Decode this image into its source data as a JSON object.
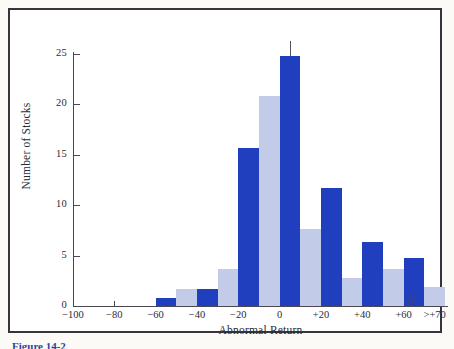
{
  "figure": {
    "caption": "Figure 14-2",
    "frame_color": "#36343a",
    "background": "#ffffff"
  },
  "colors": {
    "dark_bar": "#1f3fbf",
    "light_bar": "#c2cbe8",
    "axis": "#4a4750",
    "text": "#2b2b33",
    "caption": "#2f3f9e"
  },
  "chart_data": {
    "type": "bar",
    "title": "",
    "xlabel": "Abnormal Return",
    "ylabel": "Number of Stocks",
    "ylim": [
      0,
      26
    ],
    "yticks": [
      0,
      5,
      10,
      15,
      20,
      25
    ],
    "ytick_labels": [
      "0",
      "5",
      "10",
      "15",
      "20",
      "25"
    ],
    "xlim": [
      -100,
      80
    ],
    "xticks": [
      -100,
      -80,
      -60,
      -40,
      -20,
      0,
      20,
      40,
      60,
      75
    ],
    "xtick_labels": [
      "−100",
      "−80",
      "−60",
      "−40",
      "−20",
      "0",
      "+20",
      "+40",
      "+60",
      ">+70"
    ],
    "grid": false,
    "legend": null,
    "axis_break": "//",
    "bin_width": 10,
    "bars": [
      {
        "bin_start": -100,
        "bin_end": -90,
        "value": 0,
        "color": "dark"
      },
      {
        "bin_start": -90,
        "bin_end": -80,
        "value": 0,
        "color": "light"
      },
      {
        "bin_start": -80,
        "bin_end": -70,
        "value": 0,
        "color": "dark"
      },
      {
        "bin_start": -70,
        "bin_end": -60,
        "value": 0,
        "color": "light"
      },
      {
        "bin_start": -60,
        "bin_end": -50,
        "value": 0.8,
        "color": "dark"
      },
      {
        "bin_start": -50,
        "bin_end": -40,
        "value": 1.7,
        "color": "light"
      },
      {
        "bin_start": -40,
        "bin_end": -30,
        "value": 1.7,
        "color": "dark"
      },
      {
        "bin_start": -30,
        "bin_end": -20,
        "value": 3.7,
        "color": "light"
      },
      {
        "bin_start": -20,
        "bin_end": -10,
        "value": 15.7,
        "color": "dark"
      },
      {
        "bin_start": -10,
        "bin_end": 0,
        "value": 20.8,
        "color": "light"
      },
      {
        "bin_start": 0,
        "bin_end": 10,
        "value": 24.8,
        "color": "dark"
      },
      {
        "bin_start": 10,
        "bin_end": 20,
        "value": 7.6,
        "color": "light"
      },
      {
        "bin_start": 20,
        "bin_end": 30,
        "value": 11.7,
        "color": "dark"
      },
      {
        "bin_start": 30,
        "bin_end": 40,
        "value": 2.8,
        "color": "light"
      },
      {
        "bin_start": 40,
        "bin_end": 50,
        "value": 6.4,
        "color": "dark"
      },
      {
        "bin_start": 50,
        "bin_end": 60,
        "value": 3.7,
        "color": "light"
      },
      {
        "bin_start": 60,
        "bin_end": 70,
        "value": 4.8,
        "color": "dark"
      },
      {
        "bin_start": 70,
        "bin_end": 80,
        "value": 1.9,
        "color": "light"
      }
    ],
    "peak_marker": {
      "x": 5,
      "from": 24.8,
      "to": 26.3
    }
  }
}
